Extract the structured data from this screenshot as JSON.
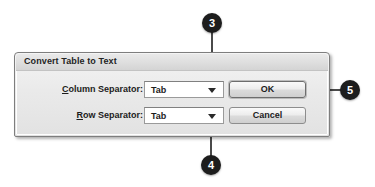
{
  "background_color": "#ffffff",
  "dialog": {
    "title": "Convert Table to Text",
    "fields": [
      {
        "label_prefix": "C",
        "label_rest": "olumn Separator:",
        "accelerator": "C",
        "control": "dropdown",
        "value": "Tab",
        "icon": "chevron-down-icon"
      },
      {
        "label_prefix": "R",
        "label_rest": "ow Separator:",
        "accelerator": "R",
        "control": "dropdown",
        "value": "Tab",
        "icon": "chevron-down-icon"
      }
    ],
    "buttons": [
      {
        "label": "OK",
        "default": true
      },
      {
        "label": "Cancel",
        "default": false
      }
    ]
  },
  "callouts": [
    {
      "number": "3",
      "target": "column-separator-dropdown-arrow",
      "orientation": "vertical-top"
    },
    {
      "number": "4",
      "target": "row-separator-dropdown-arrow",
      "orientation": "vertical-bottom"
    },
    {
      "number": "5",
      "target": "ok-button",
      "orientation": "horizontal-right"
    }
  ],
  "colors": {
    "badge_fill": "#1d1d1d",
    "badge_text": "#ffffff",
    "leader_line": "#4a4a4a",
    "dialog_border": "#7e7e7e",
    "dialog_face": "#eaeaea",
    "titlebar": "#dedede",
    "text": "#1c1c1c"
  }
}
